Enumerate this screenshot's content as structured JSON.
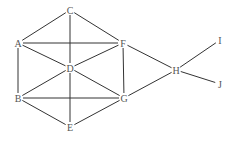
{
  "diagram": {
    "type": "undirected-graph",
    "nodes": [
      {
        "id": "A",
        "label": "A",
        "x": 18,
        "y": 43
      },
      {
        "id": "B",
        "label": "B",
        "x": 18,
        "y": 98
      },
      {
        "id": "C",
        "label": "C",
        "x": 70,
        "y": 10
      },
      {
        "id": "D",
        "label": "D",
        "x": 70,
        "y": 68
      },
      {
        "id": "E",
        "label": "E",
        "x": 70,
        "y": 127
      },
      {
        "id": "F",
        "label": "F",
        "x": 123,
        "y": 43
      },
      {
        "id": "G",
        "label": "G",
        "x": 124,
        "y": 98
      },
      {
        "id": "H",
        "label": "H",
        "x": 176,
        "y": 70
      },
      {
        "id": "I",
        "label": "I",
        "x": 220,
        "y": 40
      },
      {
        "id": "J",
        "label": "J",
        "x": 220,
        "y": 84
      }
    ],
    "edges": [
      [
        "C",
        "A"
      ],
      [
        "C",
        "F"
      ],
      [
        "C",
        "D"
      ],
      [
        "A",
        "F"
      ],
      [
        "A",
        "D"
      ],
      [
        "A",
        "B"
      ],
      [
        "D",
        "F"
      ],
      [
        "D",
        "B"
      ],
      [
        "D",
        "G"
      ],
      [
        "D",
        "E"
      ],
      [
        "F",
        "G"
      ],
      [
        "F",
        "H"
      ],
      [
        "B",
        "G"
      ],
      [
        "B",
        "E"
      ],
      [
        "E",
        "G"
      ],
      [
        "G",
        "H"
      ],
      [
        "H",
        "I"
      ],
      [
        "H",
        "J"
      ]
    ],
    "colors": {
      "edge": "#333333",
      "label": "#555555",
      "background": "#ffffff"
    }
  }
}
